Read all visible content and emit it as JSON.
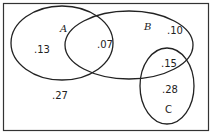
{
  "diagram": {
    "type": "venn",
    "sets": [
      {
        "name": "A",
        "label": "A"
      },
      {
        "name": "B",
        "label": "B"
      },
      {
        "name": "C",
        "label": "C"
      }
    ],
    "regions": {
      "a_only": ".13",
      "a_and_b": ".07",
      "b_only": ".10",
      "b_and_c": ".15",
      "c_only": ".28",
      "outside": ".27"
    }
  }
}
